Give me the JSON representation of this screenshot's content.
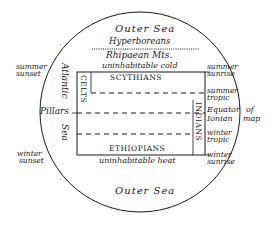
{
  "map": {
    "title": "Ionian world map",
    "colors": {
      "ink": "#1a1a1a",
      "background": "#ffffff"
    },
    "seas": {
      "outer_top": "Outer Sea",
      "outer_bottom": "Outer Sea",
      "atlantic_1": "Atlantic",
      "atlantic_2": "Sea"
    },
    "regions": {
      "hyperboreans": "Hyperboreans",
      "rhipaean": "Rhipaean Mts.",
      "cold": "uninhabitable cold",
      "scythians": "SCYTHIANS",
      "celts": "CELTS",
      "indians": "INDIANS",
      "ethiopians": "ETHIOPIANS",
      "heat": "uninhabitable heat",
      "pillars": "Pillars"
    },
    "left_labels": {
      "summer_sunset_1": "summer",
      "summer_sunset_2": "sunset",
      "winter_sunset_1": "winter",
      "winter_sunset_2": "sunset"
    },
    "right_labels": {
      "summer_sunrise_1": "summer",
      "summer_sunrise_2": "sunrise",
      "summer_tropic_1": "summer",
      "summer_tropic_2": "tropic",
      "equator_1": "Equator",
      "equator_of": "of",
      "equator_2": "Ionian",
      "equator_map": "map",
      "winter_tropic_1": "winter",
      "winter_tropic_2": "tropic",
      "winter_sunrise_1": "winter",
      "winter_sunrise_2": "sunrise"
    }
  }
}
